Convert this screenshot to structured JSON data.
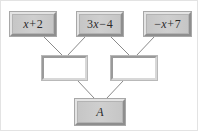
{
  "diagram": {
    "type": "expression-tree",
    "title": "",
    "background_color": "#ffffff",
    "node_fill_color": "#c9c9c9",
    "blank_fill_color": "#ffffff",
    "edge_color": "#8a8a8a",
    "text_color": "#2b2b2b",
    "nodes": [
      {
        "id": "n1",
        "row": "top",
        "label": "x+2",
        "lead": "",
        "var": "x",
        "op": "+",
        "num": "2",
        "filled": true,
        "x": 9,
        "y": 11,
        "w": 46,
        "h": 24
      },
      {
        "id": "n2",
        "row": "top",
        "label": "3x-4",
        "lead": "3",
        "var": "x",
        "op": "−",
        "num": "4",
        "filled": true,
        "x": 76,
        "y": 11,
        "w": 46,
        "h": 24
      },
      {
        "id": "n3",
        "row": "top",
        "label": "-x+7",
        "lead": "−",
        "var": "x",
        "op": "+",
        "num": "7",
        "filled": true,
        "x": 143,
        "y": 11,
        "w": 47,
        "h": 24
      },
      {
        "id": "m1",
        "row": "middle",
        "label": "",
        "filled": false,
        "x": 41,
        "y": 55,
        "w": 45,
        "h": 24
      },
      {
        "id": "m2",
        "row": "middle",
        "label": "",
        "filled": false,
        "x": 110,
        "y": 55,
        "w": 46,
        "h": 24
      },
      {
        "id": "b1",
        "row": "bottom",
        "label": "A",
        "filled": true,
        "x": 74,
        "y": 98,
        "w": 50,
        "h": 26
      }
    ],
    "edges": [
      {
        "from": "n1",
        "to": "m1",
        "x1": 43,
        "y1": 36,
        "x2": 61,
        "y2": 54
      },
      {
        "from": "n2",
        "to": "m1",
        "x1": 84,
        "y1": 36,
        "x2": 67,
        "y2": 54
      },
      {
        "from": "n2",
        "to": "m2",
        "x1": 110,
        "y1": 36,
        "x2": 128,
        "y2": 54
      },
      {
        "from": "n3",
        "to": "m2",
        "x1": 153,
        "y1": 36,
        "x2": 136,
        "y2": 54
      },
      {
        "from": "m1",
        "to": "b1",
        "x1": 77,
        "y1": 80,
        "x2": 93,
        "y2": 97
      },
      {
        "from": "m2",
        "to": "b1",
        "x1": 122,
        "y1": 80,
        "x2": 106,
        "y2": 97
      }
    ]
  }
}
